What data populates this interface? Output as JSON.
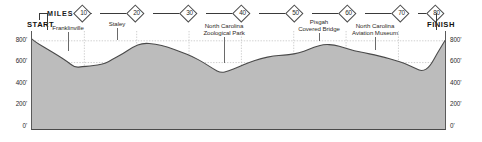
{
  "chart_data": {
    "type": "area",
    "title": "",
    "xlabel": "MILES",
    "ylabel": "",
    "xlim": [
      0,
      82
    ],
    "ylim": [
      0,
      900
    ],
    "grid": true,
    "legend_position": "none",
    "x_ticks": [
      10,
      20,
      30,
      40,
      50,
      60,
      70,
      80
    ],
    "y_ticks": [
      "0'",
      "200'",
      "400'",
      "600'",
      "800'"
    ],
    "y_tick_values": [
      0,
      200,
      400,
      600,
      800
    ],
    "start_label": "START",
    "finish_label": "FINISH",
    "series_name": "Elevation",
    "x": [
      0,
      1,
      3,
      5,
      7,
      8.5,
      10,
      11.5,
      13,
      14.5,
      16,
      18,
      20,
      22,
      24.5,
      27,
      29.5,
      32,
      34,
      36,
      37.5,
      39,
      41,
      43,
      45.5,
      48,
      50,
      52,
      54,
      56,
      58,
      60,
      62,
      64,
      66,
      68,
      70,
      72,
      74,
      76,
      77.5,
      79,
      80.5,
      82
    ],
    "values": [
      825,
      790,
      735,
      680,
      620,
      565,
      572,
      578,
      588,
      600,
      640,
      690,
      752,
      790,
      780,
      752,
      710,
      662,
      612,
      552,
      515,
      532,
      568,
      610,
      648,
      672,
      678,
      688,
      712,
      752,
      778,
      772,
      748,
      718,
      700,
      680,
      658,
      632,
      602,
      560,
      528,
      572,
      700,
      812
    ],
    "annotations": [
      {
        "label": "Franklinville",
        "mile": 8.5,
        "elevation": 565
      },
      {
        "label": "Staley",
        "mile": 19.5,
        "elevation": 748
      },
      {
        "label": "North Carolina Zoological Park",
        "mile": 40,
        "elevation": 555
      },
      {
        "label": "Pisgah Covered Bridge",
        "mile": 57,
        "elevation": 770
      },
      {
        "label": "North Carolina Aviation Museum",
        "mile": 66,
        "elevation": 700
      }
    ]
  },
  "axis": {
    "miles_label": "MILES",
    "markers": [
      {
        "value": "10"
      },
      {
        "value": "20"
      },
      {
        "value": "30"
      },
      {
        "value": "40"
      },
      {
        "value": "50"
      },
      {
        "value": "60"
      },
      {
        "value": "70"
      },
      {
        "value": "80"
      }
    ]
  },
  "endpoints": {
    "start": "START",
    "finish": "FINISH"
  },
  "y_labels": {
    "t800": "800'",
    "t600": "600'",
    "t400": "400'",
    "t200": "200'",
    "t0": "0'"
  },
  "pois": {
    "franklinville": "Franklinville",
    "staley": "Staley",
    "zoo_line1": "North Carolina",
    "zoo_line2": "Zoological Park",
    "pisgah_line1": "Pisgah",
    "pisgah_line2": "Covered Bridge",
    "aviation_line1": "North Carolina",
    "aviation_line2": "Aviation Museum"
  },
  "colors": {
    "fill": "#bcbcbc",
    "stroke": "#4a4a4a",
    "grid": "#b9b9b9",
    "text": "#231f20",
    "background": "#ffffff"
  }
}
